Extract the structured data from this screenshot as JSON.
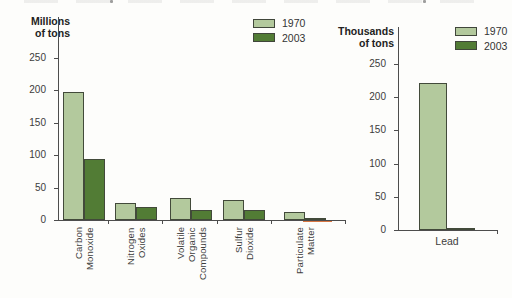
{
  "colors": {
    "series_1970": "#b3c99d",
    "series_2003": "#527c35",
    "bar_border": "#424a3a",
    "axis": "#4d4d4d",
    "text": "#3c3c3c",
    "pm_baseline_highlight": "#d4682f"
  },
  "top_artifact": {
    "note": "faint cropped remnants of a text line above the figure"
  },
  "chart_data": [
    {
      "type": "bar",
      "title": "",
      "unit_label_lines": [
        "Millions",
        "of tons"
      ],
      "ylabel": "Millions of tons",
      "ylim": [
        0,
        250
      ],
      "yticks": [
        0,
        50,
        100,
        150,
        200,
        250
      ],
      "grid": false,
      "legend_position": "top-right-of-plot",
      "legend": [
        {
          "label": "1970"
        },
        {
          "label": "2003"
        }
      ],
      "categories": [
        [
          "Carbon",
          "Monoxide"
        ],
        [
          "Nitrogen",
          "Oxides"
        ],
        [
          "Volatile",
          "Organic",
          "Compounds"
        ],
        [
          "Sulfur",
          "Dioxide"
        ],
        [
          "Particulate",
          "Matter"
        ]
      ],
      "series": [
        {
          "name": "1970",
          "values": [
            197,
            27,
            34,
            31,
            12
          ]
        },
        {
          "name": "2003",
          "values": [
            94,
            20,
            15,
            16,
            2.5
          ]
        }
      ]
    },
    {
      "type": "bar",
      "title": "",
      "unit_label_lines": [
        "Thousands",
        "of tons"
      ],
      "ylabel": "Thousands of tons",
      "ylim": [
        0,
        250
      ],
      "yticks": [
        0,
        50,
        100,
        150,
        200,
        250
      ],
      "grid": false,
      "legend_position": "top-right-of-plot",
      "legend": [
        {
          "label": "1970"
        },
        {
          "label": "2003"
        }
      ],
      "categories": [
        [
          "Lead"
        ]
      ],
      "series": [
        {
          "name": "1970",
          "values": [
            221
          ]
        },
        {
          "name": "2003",
          "values": [
            3.5
          ]
        }
      ]
    }
  ]
}
